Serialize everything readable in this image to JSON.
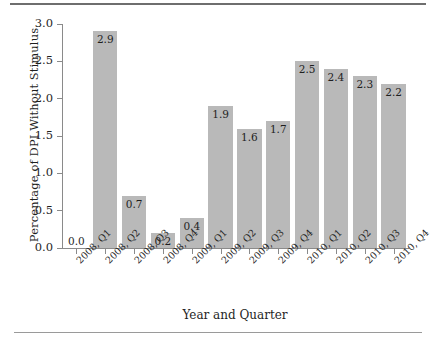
{
  "chart_data": {
    "type": "bar",
    "title": "",
    "xlabel": "Year and Quarter",
    "ylabel": "Percentage of DPI Without Stimulus",
    "categories": [
      "2008, Q1",
      "2008, Q2",
      "2008, Q3",
      "2008, Q4",
      "2009, Q1",
      "2009, Q2",
      "2009, Q3",
      "2009, Q4",
      "2010, Q1",
      "2010, Q2",
      "2010, Q3",
      "2010, Q4"
    ],
    "values": [
      0.0,
      2.9,
      0.7,
      0.2,
      0.4,
      1.9,
      1.6,
      1.7,
      2.5,
      2.4,
      2.3,
      2.2
    ],
    "data_labels": [
      "0.0",
      "2.9",
      "0.7",
      "0.2",
      "0.4",
      "1.9",
      "1.6",
      "1.7",
      "2.5",
      "2.4",
      "2.3",
      "2.2"
    ],
    "ylim": [
      0.0,
      3.0
    ],
    "ytick_values": [
      0.0,
      0.5,
      1.0,
      1.5,
      2.0,
      2.5,
      3.0
    ],
    "ytick_labels": [
      "0.0",
      "0.5",
      "1.0",
      "1.5",
      "2.0",
      "2.5",
      "3.0"
    ],
    "grid": false,
    "legend": null,
    "bar_color": "#b9b9b9",
    "axis_color": "#8a8a8a",
    "text_color": "#1f1f1f"
  }
}
